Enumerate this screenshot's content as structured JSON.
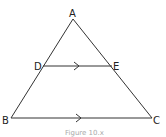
{
  "figure": {
    "type": "triangle-with-parallel-line",
    "vertices": {
      "A": {
        "label": "A",
        "x": 73,
        "y": 19
      },
      "B": {
        "label": "B",
        "x": 11,
        "y": 118
      },
      "C": {
        "label": "C",
        "x": 152,
        "y": 118
      }
    },
    "points_on_sides": {
      "D": {
        "label": "D",
        "x": 43,
        "y": 66
      },
      "E": {
        "label": "E",
        "x": 112,
        "y": 66
      }
    },
    "segments": [
      "AB",
      "AC",
      "BC",
      "DE"
    ],
    "parallel_marks": [
      "DE",
      "BC"
    ],
    "caption": "Figure 10.x",
    "stroke_color": "#333333"
  }
}
